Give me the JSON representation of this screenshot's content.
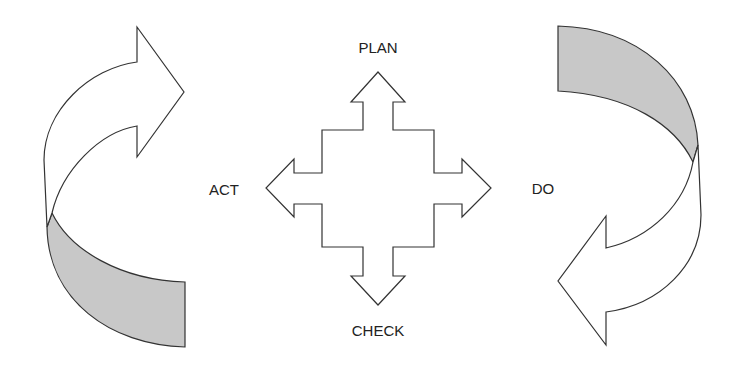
{
  "diagram": {
    "labels": {
      "plan": "PLAN",
      "do": "DO",
      "check": "CHECK",
      "act": "ACT"
    },
    "colors": {
      "outline": "#333333",
      "shaded": "#c8c8c8",
      "background": "#ffffff"
    },
    "arrows": [
      {
        "name": "left-curved-arrow",
        "direction": "clockwise-up"
      },
      {
        "name": "right-curved-arrow",
        "direction": "clockwise-down"
      },
      {
        "name": "center-four-way-arrow",
        "directions": [
          "up",
          "right",
          "down",
          "left"
        ]
      }
    ]
  }
}
